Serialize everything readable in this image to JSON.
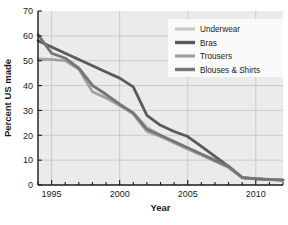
{
  "chart_data": {
    "type": "line",
    "title": "",
    "xlabel": "Year",
    "ylabel": "Percent US made",
    "xlim": [
      1994,
      2012
    ],
    "ylim": [
      0,
      70
    ],
    "xticks": [
      1995,
      2000,
      2005,
      2010
    ],
    "xtick_labels": [
      "1995",
      "2000",
      "2005",
      "2010"
    ],
    "yticks": [
      0,
      10,
      20,
      30,
      40,
      50,
      60,
      70
    ],
    "ytick_labels": [
      "0",
      "10",
      "20",
      "30",
      "40",
      "50",
      "60",
      "70"
    ],
    "minor_xtick_interval": 1,
    "grid": true,
    "legend_position": "top-right",
    "x": [
      1994,
      1995,
      1996,
      1997,
      1998,
      1999,
      2000,
      2001,
      2002,
      2003,
      2004,
      2005,
      2006,
      2007,
      2008,
      2009,
      2010,
      2011,
      2012
    ],
    "series": [
      {
        "name": "Underwear",
        "color": "#c8c8c8",
        "width": 2.6,
        "values": [
          51,
          50.5,
          50,
          47,
          40.5,
          36,
          32,
          29,
          23.5,
          20,
          17,
          14.5,
          12,
          9.5,
          7.5,
          3,
          2.5,
          2.2,
          2
        ]
      },
      {
        "name": "Bras",
        "color": "#5a5a5a",
        "width": 2.8,
        "values": [
          58,
          55.5,
          53,
          50.5,
          48,
          45.5,
          43,
          39.5,
          28,
          24,
          21.5,
          19.5,
          15.5,
          11.5,
          7.5,
          3,
          2.5,
          2.2,
          2
        ]
      },
      {
        "name": "Trousers",
        "color": "#a0a0a0",
        "width": 2.6,
        "values": [
          50.5,
          50.5,
          50,
          46.5,
          37.5,
          35,
          32,
          28.5,
          21.5,
          19.5,
          17,
          14.5,
          12,
          9.5,
          7,
          2.8,
          2.4,
          2.2,
          2
        ]
      },
      {
        "name": "Blouses & Shirts",
        "color": "#757575",
        "width": 2.8,
        "values": [
          60.5,
          53,
          51,
          47,
          40,
          36.5,
          32.5,
          29,
          22.5,
          20,
          17.5,
          15,
          12.5,
          10,
          7.5,
          3,
          2.6,
          2.3,
          2
        ]
      }
    ]
  },
  "legend": {
    "entries": [
      {
        "label": "Underwear"
      },
      {
        "label": "Bras"
      },
      {
        "label": "Trousers"
      },
      {
        "label": "Blouses & Shirts"
      }
    ]
  },
  "colors": {
    "plot_background": "#ebebeb",
    "grid": "#bdbdbd",
    "axis": "#1a1a1a",
    "legend_background": "#fafafa"
  }
}
